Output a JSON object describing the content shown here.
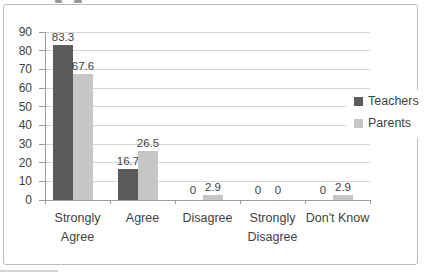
{
  "chart_data": {
    "type": "bar",
    "title": "",
    "categories": [
      "Strongly Agree",
      "Agree",
      "Disagree",
      "Strongly Disagree",
      "Don't Know"
    ],
    "series": [
      {
        "name": "Teachers",
        "color": "#5b5b5b",
        "values": [
          83.3,
          16.7,
          0,
          0,
          0
        ]
      },
      {
        "name": "Parents",
        "color": "#c6c6c6",
        "values": [
          67.6,
          26.5,
          2.9,
          0,
          2.9
        ]
      }
    ],
    "xlabel": "",
    "ylabel": "",
    "ylim": [
      0,
      90
    ],
    "yticks": [
      0,
      10,
      20,
      30,
      40,
      50,
      60,
      70,
      80,
      90
    ],
    "grid": "horizontal",
    "gridline_color": "#d6d6d6",
    "axis_color": "#9e9e9e",
    "text_color": "#3f3f3f",
    "legend_position": "right",
    "data_labels": true
  },
  "legend": {
    "items": [
      {
        "label": "Teachers",
        "color": "#5b5b5b"
      },
      {
        "label": "Parents",
        "color": "#c6c6c6"
      }
    ]
  },
  "frame": {
    "border_color": "#bdbdbd",
    "background": "#ffffff"
  }
}
